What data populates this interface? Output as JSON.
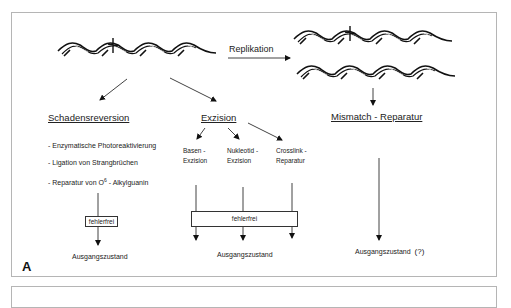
{
  "figure": {
    "panel_label": "A",
    "top_arrow_label": "Replikation",
    "branches": {
      "left": {
        "title": "Schadensreversion",
        "items": [
          "- Enzymatische Photoreaktivierung",
          "- Ligation von Strangbrüchen",
          "- Reparatur von O",
          "6",
          " - Alkylguanin"
        ],
        "box": "fehlerfrei",
        "result": "Ausgangszustand"
      },
      "middle": {
        "title": "Exzision",
        "subtypes": [
          {
            "line1": "Basen -",
            "line2": "Exzision"
          },
          {
            "line1": "Nukleotid -",
            "line2": "Exzision"
          },
          {
            "line1": "Crosslink -",
            "line2": "Reparatur"
          }
        ],
        "box": "fehlerfrei",
        "result": "Ausgangszustand"
      },
      "right": {
        "title": "Mismatch - Reparatur",
        "result": "Ausgangszustand",
        "result_note": "(?)"
      }
    },
    "icons": [
      "dna-helix-damaged",
      "dna-helix-damaged-replicated",
      "dna-helix-replicated"
    ]
  }
}
